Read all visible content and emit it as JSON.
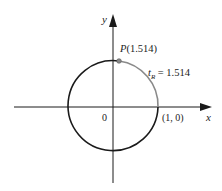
{
  "diagram": {
    "axes": {
      "x_label": "x",
      "y_label": "y",
      "origin_label": "0"
    },
    "circle": {
      "type": "unit-circle",
      "center": [
        0,
        0
      ],
      "radius": 1
    },
    "point": {
      "name": "P",
      "value": "(1.514)",
      "label": "P(1.514)"
    },
    "arc": {
      "label_var": "t",
      "label_sub": "R",
      "label_eq": " = 1.514",
      "length": 1.514
    },
    "intercept": {
      "label": "(1, 0)"
    },
    "colors": {
      "circle": "#1a1a1a",
      "arc": "#8a8a8a",
      "axes": "#1a1a1a",
      "point": "#888888"
    }
  }
}
